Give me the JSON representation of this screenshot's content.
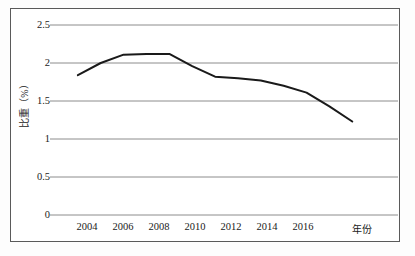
{
  "chart_data": {
    "type": "line",
    "title": "",
    "subtitle": "",
    "xlabel": "年份",
    "ylabel": "比重（%）",
    "x": [
      2004,
      2005,
      2006,
      2007,
      2008,
      2009,
      2010,
      2011,
      2012,
      2013,
      2014,
      2015,
      2016
    ],
    "series": [
      {
        "name": "比重",
        "values": [
          1.84,
          2.0,
          2.11,
          2.12,
          2.12,
          1.96,
          1.82,
          1.8,
          1.77,
          1.7,
          1.61,
          1.43,
          1.23
        ],
        "color": "#1a1a1a"
      }
    ],
    "xlim": [
      2003,
      2018
    ],
    "ylim": [
      0,
      2.5
    ],
    "xticks": [
      2004,
      2006,
      2008,
      2010,
      2012,
      2014,
      2016
    ],
    "xtick_labels": [
      "2004",
      "2006",
      "2008",
      "2010",
      "2012",
      "2014",
      "2016"
    ],
    "yticks": [
      0,
      0.5,
      1,
      1.5,
      2,
      2.5
    ],
    "ytick_labels": [
      "0",
      "0.5",
      "1",
      "1.5",
      "2",
      "2.5"
    ],
    "grid": "horizontal",
    "grid_color": "#8c8c8c",
    "legend": "none",
    "border_color": "#5a5a5a",
    "background": "#ffffff"
  },
  "axes": {
    "y_labels": [
      "2.5",
      "2",
      "1.5",
      "1",
      "0.5",
      "0"
    ],
    "x_labels": [
      "2004",
      "2006",
      "2008",
      "2010",
      "2012",
      "2014",
      "2016"
    ],
    "y_title": "比重（%）",
    "x_title": "年份"
  }
}
